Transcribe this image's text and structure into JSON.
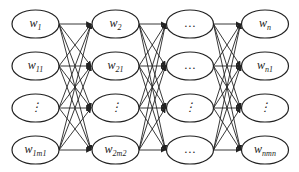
{
  "diagram": {
    "type": "layered-network",
    "stroke_color": "#222222",
    "columns": [
      {
        "nodes": [
          {
            "base": "w",
            "sub": "1"
          },
          {
            "base": "w",
            "sub": "11"
          },
          {
            "base": "⋮",
            "sub": ""
          },
          {
            "base": "w",
            "sub": "1m1"
          }
        ]
      },
      {
        "nodes": [
          {
            "base": "w",
            "sub": "2"
          },
          {
            "base": "w",
            "sub": "21"
          },
          {
            "base": "⋮",
            "sub": ""
          },
          {
            "base": "w",
            "sub": "2m2"
          }
        ]
      },
      {
        "nodes": [
          {
            "base": "…",
            "sub": ""
          },
          {
            "base": "…",
            "sub": ""
          },
          {
            "base": "⋮",
            "sub": ""
          },
          {
            "base": "…",
            "sub": ""
          }
        ]
      },
      {
        "nodes": [
          {
            "base": "w",
            "sub": "n"
          },
          {
            "base": "w",
            "sub": "n1"
          },
          {
            "base": "⋮",
            "sub": ""
          },
          {
            "base": "w",
            "sub": "nmn"
          }
        ]
      }
    ],
    "connections": "fully connected between adjacent columns"
  }
}
